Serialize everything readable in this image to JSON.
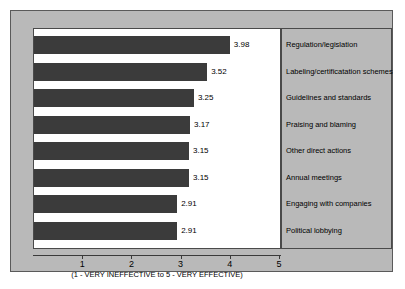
{
  "chart_data": {
    "type": "bar",
    "orientation": "horizontal",
    "title": "",
    "subtitle": "",
    "xlabel": "(1 - VERY INEFFECTIVE to 5 - VERY EFFECTIVE)",
    "ylabel": "",
    "xlim": [
      0,
      5
    ],
    "grid": false,
    "legend_position": "right",
    "x_ticks": [
      "1",
      "2",
      "3",
      "4",
      "5"
    ],
    "x_tick_values": [
      1,
      2,
      3,
      4,
      5
    ],
    "categories": [
      "Regulation/legislation",
      "Labeling/certificatation schemes",
      "Guidelines and standards",
      "Praising and blaming",
      "Other direct actions",
      "Annual meetings",
      "Engaging with companies",
      "Political lobbying"
    ],
    "values": [
      3.98,
      3.52,
      3.25,
      3.17,
      3.15,
      3.15,
      2.91,
      2.91
    ],
    "value_labels": [
      "3.98",
      "3.52",
      "3.25",
      "3.17",
      "3.15",
      "3.15",
      "2.91",
      "2.91"
    ],
    "bar_color": "#3b3b3b",
    "plot_background": "#ffffff",
    "figure_background": "#b9b9b9"
  },
  "legend": {
    "items": [
      {
        "label": "Regulation/legislation"
      },
      {
        "label": "Labeling/certificatation schemes"
      },
      {
        "label": "Guidelines and standards"
      },
      {
        "label": "Praising and blaming"
      },
      {
        "label": "Other direct actions"
      },
      {
        "label": "Annual meetings"
      },
      {
        "label": "Engaging with companies"
      },
      {
        "label": "Political lobbying"
      }
    ]
  }
}
